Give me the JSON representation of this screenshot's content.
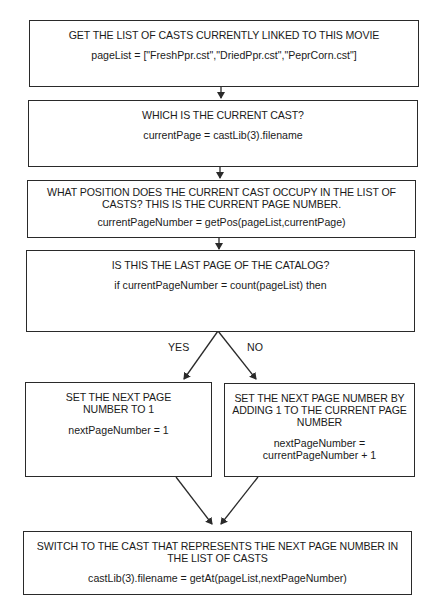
{
  "flowchart": {
    "steps": [
      {
        "heading": "GET THE LIST OF CASTS CURRENTLY LINKED TO THIS MOVIE",
        "code": "pageList = [\"FreshPpr.cst\",\"DriedPpr.cst\",\"PeprCorn.cst\"]"
      },
      {
        "heading": "WHICH IS THE CURRENT CAST?",
        "code": "currentPage = castLib(3).filename"
      },
      {
        "heading": "WHAT POSITION DOES THE CURRENT CAST OCCUPY IN THE LIST OF CASTS? THIS IS THE CURRENT PAGE NUMBER.",
        "code": "currentPageNumber = getPos(pageList,currentPage)"
      },
      {
        "heading": "IS THIS THE LAST PAGE OF THE CATALOG?",
        "code": "if currentPageNumber = count(pageList) then"
      }
    ],
    "branches": {
      "yes_label": "YES",
      "no_label": "NO",
      "yes": {
        "heading": "SET THE NEXT PAGE NUMBER TO 1",
        "code": "nextPageNumber = 1"
      },
      "no": {
        "heading": "SET THE NEXT PAGE NUMBER BY ADDING 1 TO THE CURRENT PAGE NUMBER",
        "code": "nextPageNumber = currentPageNumber + 1"
      }
    },
    "final": {
      "heading": "SWITCH TO THE CAST THAT REPRESENTS THE NEXT PAGE NUMBER IN THE LIST OF CASTS",
      "code": "castLib(3).filename = getAt(pageList,nextPageNumber)"
    }
  },
  "colors": {
    "stroke": "#2a2a2a",
    "text": "#1a1a1a",
    "background": "#ffffff"
  }
}
